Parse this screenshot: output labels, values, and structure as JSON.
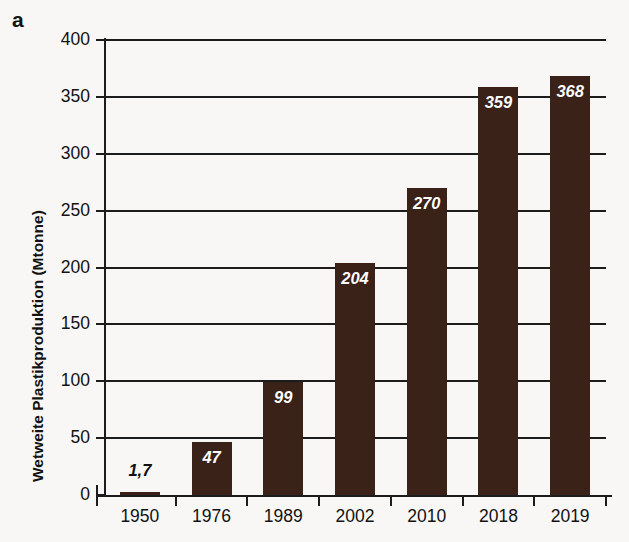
{
  "figure": {
    "panel_label": "a",
    "background_color": "#f8f7f5",
    "bar_color": "#3b2218",
    "axis_color": "#1c1c1c",
    "inside_label_color": "#ffffff",
    "outside_label_color": "#111111"
  },
  "chart_data": {
    "type": "bar",
    "title": "",
    "xlabel": "",
    "ylabel": "Wetweite Plastikproduktion (Mtonne)",
    "categories": [
      "1950",
      "1976",
      "1989",
      "2002",
      "2010",
      "2018",
      "2019"
    ],
    "values": [
      1.7,
      47,
      99,
      204,
      270,
      359,
      368
    ],
    "data_labels": [
      "1,7",
      "47",
      "99",
      "204",
      "270",
      "359",
      "368"
    ],
    "data_label_placement": [
      "outside",
      "inside",
      "inside",
      "inside",
      "inside",
      "inside",
      "inside"
    ],
    "ylim": [
      0,
      400
    ],
    "ytick_values": [
      0,
      50,
      100,
      150,
      200,
      250,
      300,
      350,
      400
    ],
    "ytick_labels": [
      "0",
      "50",
      "100",
      "150",
      "200",
      "250",
      "300",
      "350",
      "400"
    ],
    "grid": true,
    "grid_axis": "y",
    "legend": false,
    "legend_position": "none"
  }
}
